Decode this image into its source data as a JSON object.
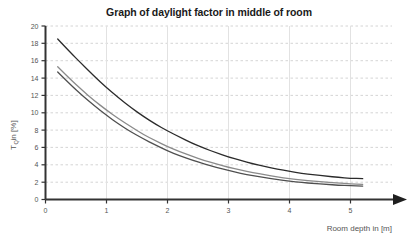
{
  "chart_data": {
    "type": "line",
    "title": "Graph of daylight factor in middle of room",
    "xlabel": "Room depth in [m]",
    "ylabel_main": "T",
    "ylabel_sub": "Q",
    "ylabel_tail": " in [%]",
    "ylabel_full": "T_Q in [%]",
    "xlim": [
      0,
      5.5
    ],
    "ylim": [
      0,
      20
    ],
    "xticks": [
      "0",
      "1",
      "2",
      "3",
      "4",
      "5"
    ],
    "xtick_values": [
      0,
      1,
      2,
      3,
      4,
      5
    ],
    "yticks": [
      "0",
      "2",
      "4",
      "6",
      "8",
      "10",
      "12",
      "14",
      "16",
      "18",
      "20"
    ],
    "ytick_values": [
      0,
      2,
      4,
      6,
      8,
      10,
      12,
      14,
      16,
      18,
      20
    ],
    "grid": "horizontal dashed at every y tick, vertical solid light at every x tick",
    "legend": "none",
    "x": [
      0.2,
      0.4,
      0.6,
      0.8,
      1.0,
      1.2,
      1.4,
      1.6,
      1.8,
      2.0,
      2.2,
      2.4,
      2.6,
      2.8,
      3.0,
      3.2,
      3.4,
      3.6,
      3.8,
      4.0,
      4.2,
      4.4,
      4.6,
      4.8,
      5.0,
      5.2
    ],
    "series": [
      {
        "name": "upper curve",
        "color": "#2b2b2b",
        "values": [
          18.5,
          17.0,
          15.6,
          14.2,
          12.9,
          11.7,
          10.6,
          9.6,
          8.7,
          7.9,
          7.2,
          6.5,
          5.9,
          5.4,
          4.9,
          4.5,
          4.1,
          3.8,
          3.5,
          3.25,
          3.0,
          2.85,
          2.7,
          2.55,
          2.45,
          2.4
        ]
      },
      {
        "name": "middle curve",
        "color": "#8a8a8a",
        "values": [
          15.3,
          13.9,
          12.6,
          11.4,
          10.3,
          9.3,
          8.4,
          7.5,
          6.8,
          6.1,
          5.5,
          5.0,
          4.5,
          4.1,
          3.7,
          3.4,
          3.1,
          2.85,
          2.6,
          2.4,
          2.25,
          2.1,
          2.0,
          1.9,
          1.8,
          1.75
        ]
      },
      {
        "name": "lower curve",
        "color": "#4f4f4f",
        "values": [
          14.7,
          13.3,
          12.0,
          10.8,
          9.7,
          8.7,
          7.8,
          7.0,
          6.3,
          5.6,
          5.05,
          4.55,
          4.1,
          3.7,
          3.35,
          3.0,
          2.75,
          2.5,
          2.3,
          2.1,
          1.95,
          1.85,
          1.75,
          1.65,
          1.6,
          1.55
        ]
      }
    ],
    "colors": {
      "axis": "#333333",
      "grid_horizontal": "#c9c9c9",
      "grid_vertical": "#e2e2e2",
      "title": "#1a1a1a",
      "tick_text": "#555555"
    }
  }
}
